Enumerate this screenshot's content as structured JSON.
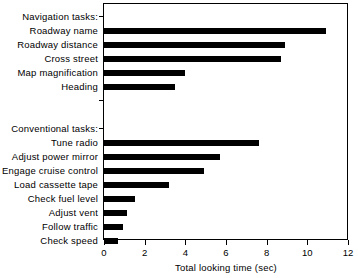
{
  "chart_data": {
    "type": "bar",
    "orientation": "horizontal",
    "title": "",
    "xlabel": "Total looking time (sec)",
    "ylabel": "",
    "xlim": [
      0,
      12
    ],
    "xticks": [
      0,
      2,
      4,
      6,
      8,
      10,
      12
    ],
    "xtick_labels": [
      "0",
      "2",
      "4",
      "6",
      "8",
      "10",
      "12"
    ],
    "grid": false,
    "legend": false,
    "bar_color": "#000000",
    "frame_color": "#000000",
    "groups": [
      {
        "label": "Navigation tasks:",
        "categories": [
          "Roadway name",
          "Roadway distance",
          "Cross street",
          "Map magnification",
          "Heading"
        ],
        "values": [
          10.9,
          8.9,
          8.7,
          4.0,
          3.5
        ]
      },
      {
        "label": "Conventional tasks:",
        "categories": [
          "Tune radio",
          "Adjust power mirror",
          "Engage cruise control",
          "Load cassette tape",
          "Check fuel level",
          "Adjust vent",
          "Follow traffic",
          "Check speed"
        ],
        "values": [
          7.6,
          5.7,
          4.9,
          3.2,
          1.5,
          1.15,
          0.95,
          0.7
        ]
      }
    ],
    "categories": [
      "Roadway name",
      "Roadway distance",
      "Cross street",
      "Map magnification",
      "Heading",
      "Tune radio",
      "Adjust power mirror",
      "Engage cruise control",
      "Load cassette tape",
      "Check fuel level",
      "Adjust vent",
      "Follow traffic",
      "Check speed"
    ],
    "values": [
      10.9,
      8.9,
      8.7,
      4.0,
      3.5,
      7.6,
      5.7,
      4.9,
      3.2,
      1.5,
      1.15,
      0.95,
      0.7
    ]
  }
}
